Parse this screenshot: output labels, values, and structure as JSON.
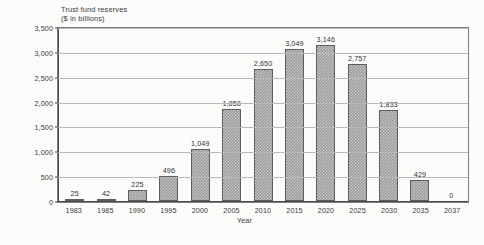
{
  "chart_data": {
    "type": "bar",
    "title": "Trust fund reserves",
    "subtitle": "($ in billions)",
    "xlabel": "Year",
    "ylabel": "",
    "categories": [
      "1983",
      "1985",
      "1990",
      "1995",
      "2000",
      "2005",
      "2010",
      "2015",
      "2020",
      "2025",
      "2030",
      "2035",
      "2037"
    ],
    "values": [
      25,
      42,
      225,
      496,
      1049,
      1858,
      2650,
      3049,
      3146,
      2757,
      1833,
      429,
      0
    ],
    "value_labels": [
      "25",
      "42",
      "225",
      "496",
      "1,049",
      "1,858",
      "2,650",
      "3,049",
      "3,146",
      "2,757",
      "1,833",
      "429",
      "0"
    ],
    "ylim": [
      0,
      3500
    ],
    "ytick_values": [
      0,
      500,
      1000,
      1500,
      2000,
      2500,
      3000,
      3500
    ],
    "ytick_labels": [
      "0",
      "500",
      "1,000",
      "1,500",
      "2,000",
      "2,500",
      "3,000",
      "3,500"
    ],
    "grid": "horizontal",
    "legend": "none",
    "series_name": "Trust fund reserves",
    "bar_color": "#9d9d9d",
    "bar_border_color": "#5d5d5d",
    "gridline_color": "#b9b9b9",
    "axis_color": "#4a4a4a",
    "background_color": "#fbfbfa"
  }
}
